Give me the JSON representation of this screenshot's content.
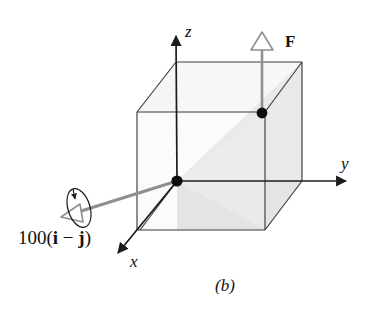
{
  "figure": {
    "caption": "(b)",
    "type": "3d-free-body-diagram"
  },
  "axes": {
    "z_label": "z",
    "y_label": "y",
    "x_label": "x"
  },
  "vectors": {
    "force_label": "F",
    "moment_label_prefix": "100(",
    "moment_i": "i",
    "moment_minus": " − ",
    "moment_j": "j",
    "moment_label_suffix": ")"
  },
  "colors": {
    "outline": "#3a3a3a",
    "vector_gray": "#8a8a8a",
    "dot_black": "#0d0d0d",
    "face_light": "#f4f4f4",
    "face_shade": "#e6e6e6",
    "background": "#ffffff",
    "text": "#111111"
  },
  "geometry": {
    "origin": {
      "x": 177,
      "y": 181
    },
    "force_point": {
      "x": 262,
      "y": 113
    },
    "z_axis_tip": {
      "x": 176,
      "y": 30
    },
    "y_axis_tip": {
      "x": 352,
      "y": 181
    },
    "x_axis_tip": {
      "x": 113,
      "y": 258
    }
  }
}
